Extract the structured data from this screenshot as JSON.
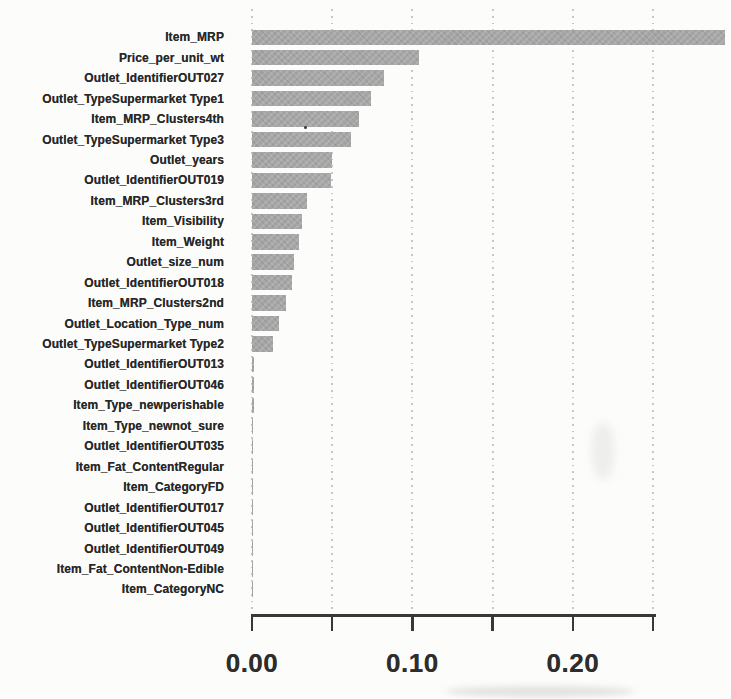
{
  "chart_data": {
    "type": "bar",
    "orientation": "horizontal",
    "title": "",
    "xlabel": "",
    "ylabel": "",
    "xlim": [
      0,
      0.295
    ],
    "grid": "dotted-vertical",
    "legend": "none",
    "x_ticks": [
      0,
      0.05,
      0.1,
      0.15,
      0.2,
      0.25
    ],
    "x_tick_labels": [
      "0.00",
      "",
      "0.10",
      "",
      "0.20",
      ""
    ],
    "categories": [
      "Item_MRP",
      "Price_per_unit_wt",
      "Outlet_IdentifierOUT027",
      "Outlet_TypeSupermarket Type1",
      "Item_MRP_Clusters4th",
      "Outlet_TypeSupermarket Type3",
      "Outlet_years",
      "Outlet_IdentifierOUT019",
      "Item_MRP_Clusters3rd",
      "Item_Visibility",
      "Item_Weight",
      "Outlet_size_num",
      "Outlet_IdentifierOUT018",
      "Item_MRP_Clusters2nd",
      "Outlet_Location_Type_num",
      "Outlet_TypeSupermarket Type2",
      "Outlet_IdentifierOUT013",
      "Outlet_IdentifierOUT046",
      "Item_Type_newperishable",
      "Item_Type_newnot_sure",
      "Outlet_IdentifierOUT035",
      "Item_Fat_ContentRegular",
      "Item_CategoryFD",
      "Outlet_IdentifierOUT017",
      "Outlet_IdentifierOUT045",
      "Outlet_IdentifierOUT049",
      "Item_Fat_ContentNon-Edible",
      "Item_CategoryNC"
    ],
    "values": [
      0.295,
      0.104,
      0.082,
      0.074,
      0.067,
      0.062,
      0.05,
      0.049,
      0.034,
      0.031,
      0.029,
      0.026,
      0.025,
      0.021,
      0.017,
      0.013,
      0.0013,
      0.0013,
      0.0013,
      0.0005,
      0.0004,
      0.0004,
      0.0003,
      0.0003,
      0.0003,
      0.0003,
      0.0002,
      0.0002
    ]
  },
  "colors": {
    "background": "#fcfcfb",
    "bar": "#a6a6a6",
    "grid": "#c6c6c6",
    "axis": "#383838",
    "text": "#282828"
  }
}
